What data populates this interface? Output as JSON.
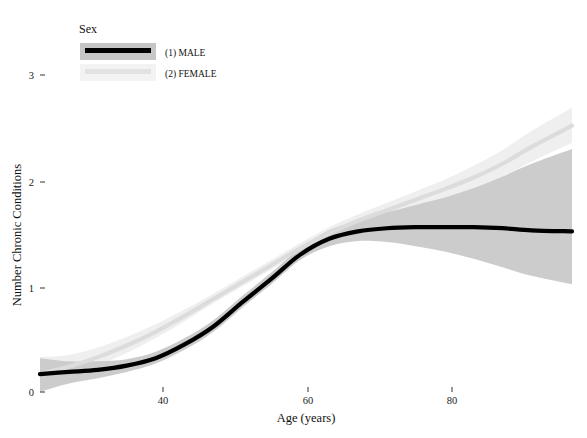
{
  "chart_data": {
    "type": "line",
    "title": "",
    "xlabel": "Age (years)",
    "ylabel": "Number Chronic Conditions",
    "xlim": [
      23,
      96.6
    ],
    "ylim": [
      -0.05,
      3.0
    ],
    "xticks": [
      40,
      60,
      80
    ],
    "xtick_labels": [
      "40",
      "60",
      "80"
    ],
    "yticks": [
      0,
      1,
      2,
      3
    ],
    "ytick_labels": [
      "0",
      "1",
      "2",
      "3"
    ],
    "grid": false,
    "legend": {
      "title": "Sex",
      "position": "top-left-inside",
      "entries": [
        {
          "label": "(1) MALE",
          "line_color": "#000000",
          "band_color": "#c9c9c9"
        },
        {
          "label": "(2) FEMALE",
          "line_color": "#dcdcdc",
          "band_color": "#efefef"
        }
      ]
    },
    "series": [
      {
        "name": "(1) MALE",
        "x": [
          23,
          27,
          31,
          35,
          39,
          43,
          47,
          51,
          55,
          59,
          63,
          67,
          71,
          75,
          79,
          83,
          87,
          91,
          96.6
        ],
        "y": [
          0.17,
          0.19,
          0.21,
          0.25,
          0.32,
          0.45,
          0.62,
          0.85,
          1.07,
          1.3,
          1.45,
          1.52,
          1.55,
          1.56,
          1.56,
          1.56,
          1.55,
          1.53,
          1.52
        ],
        "ci_lower": [
          0.0,
          0.08,
          0.13,
          0.19,
          0.27,
          0.4,
          0.57,
          0.8,
          1.02,
          1.25,
          1.38,
          1.43,
          1.42,
          1.38,
          1.33,
          1.26,
          1.18,
          1.1,
          1.02
        ],
        "ci_upper": [
          0.32,
          0.29,
          0.29,
          0.31,
          0.38,
          0.51,
          0.68,
          0.91,
          1.13,
          1.36,
          1.53,
          1.62,
          1.7,
          1.77,
          1.84,
          1.93,
          2.04,
          2.16,
          2.3
        ]
      },
      {
        "name": "(2) FEMALE",
        "x": [
          23,
          27,
          31,
          35,
          39,
          43,
          47,
          51,
          55,
          59,
          63,
          67,
          71,
          75,
          79,
          83,
          87,
          91,
          96.6
        ],
        "y": [
          0.17,
          0.24,
          0.33,
          0.44,
          0.57,
          0.72,
          0.88,
          1.04,
          1.2,
          1.36,
          1.5,
          1.62,
          1.72,
          1.82,
          1.92,
          2.03,
          2.16,
          2.32,
          2.52
        ],
        "ci_lower": [
          0.02,
          0.14,
          0.25,
          0.37,
          0.51,
          0.67,
          0.84,
          1.0,
          1.16,
          1.32,
          1.45,
          1.56,
          1.65,
          1.74,
          1.83,
          1.93,
          2.04,
          2.18,
          2.36
        ],
        "ci_upper": [
          0.33,
          0.35,
          0.42,
          0.52,
          0.64,
          0.78,
          0.93,
          1.09,
          1.25,
          1.41,
          1.56,
          1.68,
          1.79,
          1.9,
          2.01,
          2.14,
          2.29,
          2.47,
          2.69
        ]
      }
    ]
  },
  "axes": {
    "y_title": "Number Chronic Conditions",
    "x_title": "Age (years)"
  },
  "colors": {
    "male_line": "#000000",
    "male_band": "#c6c6c6",
    "female_line": "#dedede",
    "female_band": "#f0f0f0",
    "text": "#111111",
    "background": "#ffffff"
  }
}
